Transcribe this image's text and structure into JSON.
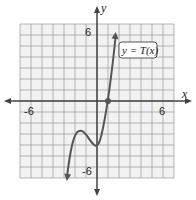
{
  "chart_data": {
    "type": "line",
    "title": "",
    "function_label": "y = T(x)",
    "xlabel": "x",
    "ylabel": "y",
    "xlim": [
      -7,
      7
    ],
    "ylim": [
      -7,
      7
    ],
    "grid": true,
    "tick_labels": {
      "x": [
        "-6",
        "6"
      ],
      "y": [
        "6",
        "-6"
      ]
    },
    "points": [
      {
        "x": -2.75,
        "y": -7.0
      },
      {
        "x": -2.4,
        "y": -4.5
      },
      {
        "x": -2.0,
        "y": -3.0
      },
      {
        "x": -1.5,
        "y": -2.6
      },
      {
        "x": -1.0,
        "y": -3.0
      },
      {
        "x": -0.5,
        "y": -3.8
      },
      {
        "x": 0.0,
        "y": -4.2
      },
      {
        "x": 0.4,
        "y": -3.3
      },
      {
        "x": 1.0,
        "y": 0.0
      },
      {
        "x": 1.5,
        "y": 4.0
      },
      {
        "x": 1.7,
        "y": 6.0
      }
    ],
    "marked_points": [
      {
        "x": 1,
        "y": 0
      }
    ],
    "color": "#555555"
  }
}
